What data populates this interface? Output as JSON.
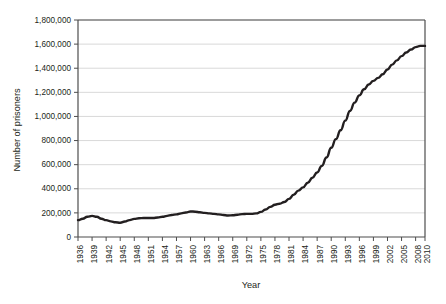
{
  "chart_data": {
    "type": "line",
    "title": "",
    "xlabel": "Year",
    "ylabel": "Number of prisoners",
    "xlim": [
      1936,
      2010
    ],
    "ylim": [
      0,
      1800000
    ],
    "grid": true,
    "legend": null,
    "legend_position": "none",
    "line_color": "#231f20",
    "grid_color": "#c9c9c9",
    "axis_color": "#4d4d4d",
    "ytick_labels": [
      "0",
      "200,000",
      "400,000",
      "600,000",
      "800,000",
      "1,000,000",
      "1,200,000",
      "1,400,000",
      "1,600,000",
      "1,800,000"
    ],
    "ytick_values": [
      0,
      200000,
      400000,
      600000,
      800000,
      1000000,
      1200000,
      1400000,
      1600000,
      1800000
    ],
    "xtick_labels": [
      "1936",
      "1939",
      "1942",
      "1945",
      "1948",
      "1951",
      "1954",
      "1957",
      "1960",
      "1963",
      "1966",
      "1969",
      "1972",
      "1975",
      "1978",
      "1981",
      "1984",
      "1987",
      "1990",
      "1993",
      "1996",
      "1999",
      "2002",
      "2005",
      "2008",
      "2010"
    ],
    "xtick_values": [
      1936,
      1939,
      1942,
      1945,
      1948,
      1951,
      1954,
      1957,
      1960,
      1963,
      1966,
      1969,
      1972,
      1975,
      1978,
      1981,
      1984,
      1987,
      1990,
      1993,
      1996,
      1999,
      2002,
      2005,
      2008,
      2010
    ],
    "series": [
      {
        "name": "Number of prisoners",
        "x": [
          1936,
          1937,
          1938,
          1939,
          1940,
          1941,
          1942,
          1943,
          1944,
          1945,
          1946,
          1947,
          1948,
          1949,
          1950,
          1951,
          1952,
          1953,
          1954,
          1955,
          1956,
          1957,
          1958,
          1959,
          1960,
          1961,
          1962,
          1963,
          1964,
          1965,
          1966,
          1967,
          1968,
          1969,
          1970,
          1971,
          1972,
          1973,
          1974,
          1975,
          1976,
          1977,
          1978,
          1979,
          1980,
          1981,
          1982,
          1983,
          1984,
          1985,
          1986,
          1987,
          1988,
          1989,
          1990,
          1991,
          1992,
          1993,
          1994,
          1995,
          1996,
          1997,
          1998,
          1999,
          2000,
          2001,
          2002,
          2003,
          2004,
          2005,
          2006,
          2007,
          2008,
          2009,
          2010
        ],
        "values": [
          140000,
          152000,
          168000,
          175000,
          168000,
          152000,
          140000,
          130000,
          122000,
          118000,
          128000,
          140000,
          150000,
          156000,
          158000,
          157000,
          158000,
          162000,
          168000,
          175000,
          182000,
          188000,
          196000,
          203000,
          212000,
          210000,
          205000,
          200000,
          196000,
          192000,
          188000,
          182000,
          178000,
          180000,
          185000,
          190000,
          192000,
          192000,
          196000,
          208000,
          228000,
          250000,
          268000,
          276000,
          290000,
          316000,
          350000,
          385000,
          412000,
          450000,
          492000,
          535000,
          590000,
          660000,
          740000,
          812000,
          885000,
          965000,
          1045000,
          1115000,
          1175000,
          1225000,
          1265000,
          1295000,
          1320000,
          1350000,
          1390000,
          1430000,
          1465000,
          1500000,
          1530000,
          1555000,
          1575000,
          1585000,
          1585000
        ]
      }
    ]
  }
}
